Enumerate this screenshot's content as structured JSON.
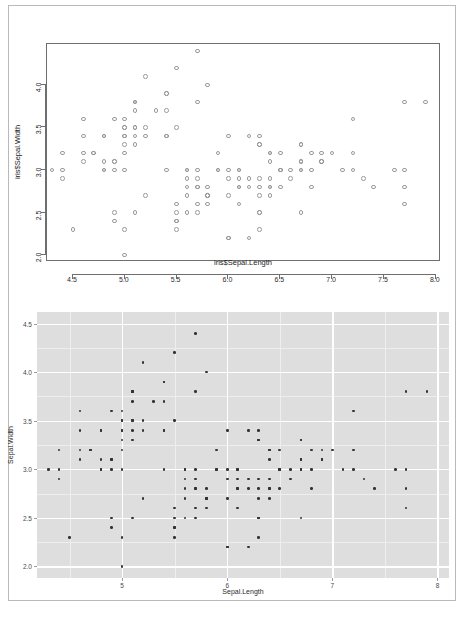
{
  "page": {
    "background_color": "#ffffff",
    "border_color": "#b9b9b9"
  },
  "chart_data": [
    {
      "id": "base-r-scatter",
      "type": "scatter",
      "renderer": "base-R",
      "title": "",
      "xlabel": "iris$Sepal.Length",
      "ylabel": "iris$Sepal.Width",
      "xlim": [
        4.25,
        8.05
      ],
      "ylim": [
        1.92,
        4.48
      ],
      "xticks": [
        4.5,
        5.0,
        5.5,
        6.0,
        6.5,
        7.0,
        7.5,
        8.0
      ],
      "xticklabels": [
        "4.5",
        "5.0",
        "5.5",
        "6.0",
        "6.5",
        "7.0",
        "7.5",
        "8.0"
      ],
      "yticks": [
        2.0,
        2.5,
        3.0,
        3.5,
        4.0
      ],
      "yticklabels": [
        "2.0",
        "2.5",
        "3.0",
        "3.5",
        "4.0"
      ],
      "grid": false,
      "legend": false,
      "marker": "open-circle",
      "marker_color": "#9a9a9a",
      "panel_border_color": "#6e6e6e",
      "panel_background": "#ffffff",
      "n_points": 150,
      "x": [
        5.1,
        4.9,
        4.7,
        4.6,
        5.0,
        5.4,
        4.6,
        5.0,
        4.4,
        4.9,
        5.4,
        4.8,
        4.8,
        4.3,
        5.8,
        5.7,
        5.4,
        5.1,
        5.7,
        5.1,
        5.4,
        5.1,
        4.6,
        5.1,
        4.8,
        5.0,
        5.0,
        5.2,
        5.2,
        4.7,
        4.8,
        5.4,
        5.2,
        5.5,
        4.9,
        5.0,
        5.5,
        4.9,
        4.4,
        5.1,
        5.0,
        4.5,
        4.4,
        5.0,
        5.1,
        4.8,
        5.1,
        4.6,
        5.3,
        5.0,
        7.0,
        6.4,
        6.9,
        5.5,
        6.5,
        5.7,
        6.3,
        4.9,
        6.6,
        5.2,
        5.0,
        5.9,
        6.0,
        6.1,
        5.6,
        6.7,
        5.6,
        5.8,
        6.2,
        5.6,
        5.9,
        6.1,
        6.3,
        6.1,
        6.4,
        6.6,
        6.8,
        6.7,
        6.0,
        5.7,
        5.5,
        5.5,
        5.8,
        6.0,
        5.4,
        6.0,
        6.7,
        6.3,
        5.6,
        5.5,
        5.5,
        6.1,
        5.8,
        5.0,
        5.6,
        5.7,
        5.7,
        6.2,
        5.1,
        5.7,
        6.3,
        5.8,
        7.1,
        6.3,
        6.5,
        7.6,
        4.9,
        7.3,
        6.7,
        7.2,
        6.5,
        6.4,
        6.8,
        5.7,
        5.8,
        6.4,
        6.5,
        7.7,
        7.7,
        6.0,
        6.9,
        5.6,
        7.7,
        6.3,
        6.7,
        7.2,
        6.2,
        6.1,
        6.4,
        7.2,
        7.4,
        7.9,
        6.4,
        6.3,
        6.1,
        7.7,
        6.3,
        6.4,
        6.0,
        6.9,
        6.7,
        6.9,
        5.8,
        6.8,
        6.7,
        6.7,
        6.3,
        6.5,
        6.2,
        5.9
      ],
      "y": [
        3.5,
        3.0,
        3.2,
        3.1,
        3.6,
        3.9,
        3.4,
        3.4,
        2.9,
        3.1,
        3.7,
        3.4,
        3.0,
        3.0,
        4.0,
        4.4,
        3.9,
        3.5,
        3.8,
        3.8,
        3.4,
        3.7,
        3.6,
        3.3,
        3.4,
        3.0,
        3.4,
        3.5,
        3.4,
        3.2,
        3.1,
        3.4,
        4.1,
        4.2,
        3.1,
        3.2,
        3.5,
        3.6,
        3.0,
        3.4,
        3.5,
        2.3,
        3.2,
        3.5,
        3.8,
        3.0,
        3.8,
        3.2,
        3.7,
        3.3,
        3.2,
        3.2,
        3.1,
        2.3,
        2.8,
        2.8,
        3.3,
        2.4,
        2.9,
        2.7,
        2.0,
        3.0,
        2.2,
        2.9,
        2.9,
        3.1,
        3.0,
        2.7,
        2.2,
        2.5,
        3.2,
        2.8,
        2.5,
        2.8,
        2.9,
        3.0,
        2.8,
        3.0,
        2.9,
        2.6,
        2.4,
        2.4,
        2.7,
        2.7,
        3.0,
        3.4,
        3.1,
        2.3,
        3.0,
        2.5,
        2.6,
        3.0,
        2.6,
        2.3,
        2.7,
        3.0,
        2.9,
        2.9,
        2.5,
        2.8,
        3.3,
        2.7,
        3.0,
        2.9,
        3.0,
        3.0,
        2.5,
        2.9,
        2.5,
        3.6,
        3.2,
        2.7,
        3.0,
        2.5,
        2.8,
        3.2,
        3.0,
        3.8,
        2.6,
        2.2,
        3.2,
        2.8,
        2.8,
        2.7,
        3.3,
        3.2,
        2.8,
        3.0,
        2.8,
        3.0,
        2.8,
        3.8,
        2.8,
        2.8,
        2.6,
        3.0,
        3.4,
        3.1,
        3.0,
        3.1,
        3.1,
        3.1,
        2.7,
        3.2,
        3.3,
        3.0,
        2.5,
        3.0,
        3.4,
        3.0
      ]
    },
    {
      "id": "ggplot-scatter",
      "type": "scatter",
      "renderer": "ggplot2",
      "title": "",
      "xlabel": "Sepal.Length",
      "ylabel": "Sepal.Width",
      "xlim": [
        4.19,
        8.11
      ],
      "ylim": [
        1.88,
        4.62
      ],
      "xticks": [
        5,
        6,
        7,
        8
      ],
      "xticklabels": [
        "5",
        "6",
        "7",
        "8"
      ],
      "xminorticks": [
        4.5,
        5.5,
        6.5,
        7.5
      ],
      "yticks": [
        2.0,
        2.5,
        3.0,
        3.5,
        4.0,
        4.5
      ],
      "yticklabels": [
        "2.0",
        "2.5",
        "3.0",
        "3.5",
        "4.0",
        "4.5"
      ],
      "yminorticks": [
        2.25,
        2.75,
        3.25,
        3.75,
        4.25
      ],
      "grid": true,
      "legend": false,
      "marker": "filled-circle",
      "marker_color": "#333333",
      "panel_background": "#dedede",
      "grid_major_color": "#ffffff",
      "grid_minor_color": "#eeeeee",
      "n_points": 150,
      "x": [
        5.1,
        4.9,
        4.7,
        4.6,
        5.0,
        5.4,
        4.6,
        5.0,
        4.4,
        4.9,
        5.4,
        4.8,
        4.8,
        4.3,
        5.8,
        5.7,
        5.4,
        5.1,
        5.7,
        5.1,
        5.4,
        5.1,
        4.6,
        5.1,
        4.8,
        5.0,
        5.0,
        5.2,
        5.2,
        4.7,
        4.8,
        5.4,
        5.2,
        5.5,
        4.9,
        5.0,
        5.5,
        4.9,
        4.4,
        5.1,
        5.0,
        4.5,
        4.4,
        5.0,
        5.1,
        4.8,
        5.1,
        4.6,
        5.3,
        5.0,
        7.0,
        6.4,
        6.9,
        5.5,
        6.5,
        5.7,
        6.3,
        4.9,
        6.6,
        5.2,
        5.0,
        5.9,
        6.0,
        6.1,
        5.6,
        6.7,
        5.6,
        5.8,
        6.2,
        5.6,
        5.9,
        6.1,
        6.3,
        6.1,
        6.4,
        6.6,
        6.8,
        6.7,
        6.0,
        5.7,
        5.5,
        5.5,
        5.8,
        6.0,
        5.4,
        6.0,
        6.7,
        6.3,
        5.6,
        5.5,
        5.5,
        6.1,
        5.8,
        5.0,
        5.6,
        5.7,
        5.7,
        6.2,
        5.1,
        5.7,
        6.3,
        5.8,
        7.1,
        6.3,
        6.5,
        7.6,
        4.9,
        7.3,
        6.7,
        7.2,
        6.5,
        6.4,
        6.8,
        5.7,
        5.8,
        6.4,
        6.5,
        7.7,
        7.7,
        6.0,
        6.9,
        5.6,
        7.7,
        6.3,
        6.7,
        7.2,
        6.2,
        6.1,
        6.4,
        7.2,
        7.4,
        7.9,
        6.4,
        6.3,
        6.1,
        7.7,
        6.3,
        6.4,
        6.0,
        6.9,
        6.7,
        6.9,
        5.8,
        6.8,
        6.7,
        6.7,
        6.3,
        6.5,
        6.2,
        5.9
      ],
      "y": [
        3.5,
        3.0,
        3.2,
        3.1,
        3.6,
        3.9,
        3.4,
        3.4,
        2.9,
        3.1,
        3.7,
        3.4,
        3.0,
        3.0,
        4.0,
        4.4,
        3.9,
        3.5,
        3.8,
        3.8,
        3.4,
        3.7,
        3.6,
        3.3,
        3.4,
        3.0,
        3.4,
        3.5,
        3.4,
        3.2,
        3.1,
        3.4,
        4.1,
        4.2,
        3.1,
        3.2,
        3.5,
        3.6,
        3.0,
        3.4,
        3.5,
        2.3,
        3.2,
        3.5,
        3.8,
        3.0,
        3.8,
        3.2,
        3.7,
        3.3,
        3.2,
        3.2,
        3.1,
        2.3,
        2.8,
        2.8,
        3.3,
        2.4,
        2.9,
        2.7,
        2.0,
        3.0,
        2.2,
        2.9,
        2.9,
        3.1,
        3.0,
        2.7,
        2.2,
        2.5,
        3.2,
        2.8,
        2.5,
        2.8,
        2.9,
        3.0,
        2.8,
        3.0,
        2.9,
        2.6,
        2.4,
        2.4,
        2.7,
        2.7,
        3.0,
        3.4,
        3.1,
        2.3,
        3.0,
        2.5,
        2.6,
        3.0,
        2.6,
        2.3,
        2.7,
        3.0,
        2.9,
        2.9,
        2.5,
        2.8,
        3.3,
        2.7,
        3.0,
        2.9,
        3.0,
        3.0,
        2.5,
        2.9,
        2.5,
        3.6,
        3.2,
        2.7,
        3.0,
        2.5,
        2.8,
        3.2,
        3.0,
        3.8,
        2.6,
        2.2,
        3.2,
        2.8,
        2.8,
        2.7,
        3.3,
        3.2,
        2.8,
        3.0,
        2.8,
        3.0,
        2.8,
        3.8,
        2.8,
        2.8,
        2.6,
        3.0,
        3.4,
        3.1,
        3.0,
        3.1,
        3.1,
        3.1,
        2.7,
        3.2,
        3.3,
        3.0,
        2.5,
        3.0,
        3.4,
        3.0
      ]
    }
  ]
}
